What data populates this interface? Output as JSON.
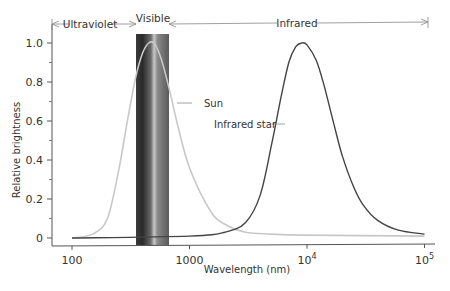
{
  "chart_data": {
    "type": "line",
    "title": "",
    "xlabel": "Wavelength (nm)",
    "ylabel": "Relative brightness",
    "xscale": "log",
    "xlim": [
      80,
      100000
    ],
    "ylim": [
      0,
      1.1
    ],
    "x_ticks": [
      {
        "value": 100,
        "label": "100"
      },
      {
        "value": 1000,
        "label": "1000"
      },
      {
        "value": 10000,
        "label": "10",
        "sup": "4"
      },
      {
        "value": 100000,
        "label": "10",
        "sup": "5"
      }
    ],
    "y_ticks": [
      {
        "value": 0,
        "label": "0"
      },
      {
        "value": 0.2,
        "label": "0.2"
      },
      {
        "value": 0.4,
        "label": "0.4"
      },
      {
        "value": 0.6,
        "label": "0.6"
      },
      {
        "value": 0.8,
        "label": "0.8"
      },
      {
        "value": 1.0,
        "label": "1.0"
      }
    ],
    "grid": false,
    "regions": [
      {
        "name": "Ultraviolet",
        "from": 100,
        "to": 400
      },
      {
        "name": "Visible",
        "from": 400,
        "to": 700
      },
      {
        "name": "Infrared",
        "from": 700,
        "to": 100000
      }
    ],
    "series": [
      {
        "name": "Sun",
        "color": "#c8c8c8",
        "x": [
          100,
          150,
          200,
          250,
          300,
          350,
          400,
          450,
          500,
          550,
          600,
          700,
          800,
          1000,
          1500,
          2000,
          3000,
          5000,
          10000,
          100000
        ],
        "y": [
          0.0,
          0.02,
          0.1,
          0.35,
          0.62,
          0.83,
          0.95,
          1.0,
          1.0,
          0.95,
          0.88,
          0.72,
          0.57,
          0.36,
          0.14,
          0.07,
          0.03,
          0.02,
          0.015,
          0.01
        ]
      },
      {
        "name": "Infrared star",
        "color": "#444444",
        "x": [
          100,
          1000,
          2000,
          3000,
          4000,
          5000,
          6000,
          7000,
          8000,
          9000,
          10000,
          12000,
          14000,
          17000,
          20000,
          25000,
          30000,
          40000,
          60000,
          100000
        ],
        "y": [
          0.0,
          0.01,
          0.03,
          0.08,
          0.22,
          0.48,
          0.72,
          0.9,
          0.98,
          1.0,
          0.99,
          0.91,
          0.78,
          0.58,
          0.42,
          0.26,
          0.17,
          0.09,
          0.04,
          0.02
        ]
      }
    ],
    "annotations": [
      {
        "text": "Sun",
        "points_to": "Sun"
      },
      {
        "text": "Infrared star",
        "points_to": "Infrared star"
      }
    ],
    "legend": "none (inline labels)"
  }
}
